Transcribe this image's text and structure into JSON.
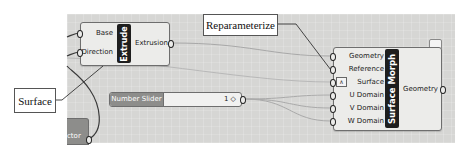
{
  "canvas": {
    "background": "#d6d6d4"
  },
  "extrude": {
    "title": "Extrude",
    "inputs": [
      "Base",
      "Direction"
    ],
    "outputs": [
      "Extrusion"
    ]
  },
  "surface_morph": {
    "title": "Surface Morph",
    "inputs": [
      "Geometry",
      "Reference",
      "Surface",
      "U Domain",
      "V Domain",
      "W Domain"
    ],
    "outputs": [
      "Geometry"
    ],
    "surface_input_icon": "reparameterize-icon"
  },
  "number_slider": {
    "label": "Number Slider",
    "value": "1",
    "value_marker": "◇"
  },
  "partial_component": {
    "label": "ctor"
  },
  "callouts": {
    "reparameterize": "Reparameterize",
    "surface": "Surface"
  }
}
